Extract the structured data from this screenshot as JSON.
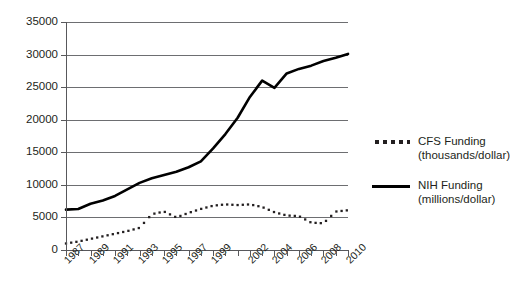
{
  "chart_data": {
    "type": "line",
    "title": "",
    "xlabel": "",
    "ylabel": "",
    "ylim": [
      0,
      35000
    ],
    "ytick_values": [
      0,
      5000,
      10000,
      15000,
      20000,
      25000,
      30000,
      35000
    ],
    "ytick_labels": [
      "0",
      "5000",
      "10000",
      "15000",
      "20000",
      "25000",
      "30000",
      "35000"
    ],
    "grid": true,
    "legend_position": "right",
    "x": [
      1987,
      1988,
      1989,
      1990,
      1991,
      1992,
      1993,
      1994,
      1995,
      1996,
      1997,
      1998,
      1999,
      2000,
      2001,
      2002,
      2003,
      2004,
      2005,
      2006,
      2007,
      2008,
      2009,
      2010
    ],
    "xtick_labels": [
      "1987",
      "",
      "1989",
      "",
      "1991",
      "",
      "1993",
      "",
      "1995",
      "",
      "1997",
      "",
      "1999",
      "",
      "",
      "2002",
      "",
      "2004",
      "",
      "2006",
      "",
      "2008",
      "",
      "2010"
    ],
    "series": [
      {
        "name": "CFS Funding (thousands/dollar)",
        "style": "dotted",
        "color": "#231f20",
        "values": [
          1000,
          1300,
          1700,
          2100,
          2500,
          2900,
          3400,
          5500,
          5900,
          5000,
          5700,
          6300,
          6800,
          7000,
          6900,
          7000,
          6600,
          5800,
          5300,
          5200,
          4200,
          4100,
          5900,
          6100
        ]
      },
      {
        "name": "NIH Funding (millions/dollar)",
        "style": "solid",
        "color": "#000000",
        "values": [
          6200,
          6300,
          7100,
          7600,
          8300,
          9300,
          10300,
          11000,
          11500,
          12000,
          12700,
          13600,
          15600,
          17800,
          20300,
          23500,
          26000,
          24900,
          27100,
          27800,
          28300,
          29000,
          29500,
          30100
        ]
      }
    ]
  },
  "legend": {
    "entries": [
      {
        "marker": "dotted",
        "line1": "CFS Funding",
        "line2": "(thousands/dollar)"
      },
      {
        "marker": "solid",
        "line1": "NIH Funding",
        "line2": "(millions/dollar)"
      }
    ]
  }
}
